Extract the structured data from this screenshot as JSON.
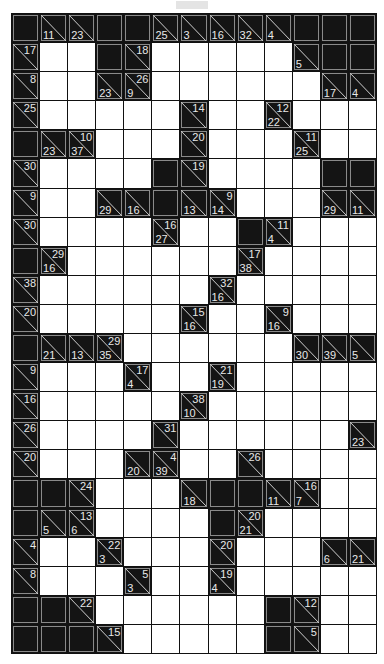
{
  "puzzle": {
    "type": "kakuro",
    "cols": 13,
    "rows": 22,
    "grid": [
      [
        "B",
        {
          "d": 11
        },
        {
          "d": 23
        },
        "B",
        "B",
        {
          "d": 25
        },
        {
          "d": 3
        },
        {
          "d": 16
        },
        {
          "d": 32
        },
        {
          "d": 4
        },
        "B",
        "B",
        "B"
      ],
      [
        {
          "r": 17
        },
        "W",
        "W",
        "B",
        {
          "r": 18
        },
        "W",
        "W",
        "W",
        "W",
        "W",
        {
          "d": 5
        },
        "B",
        "B"
      ],
      [
        {
          "r": 8
        },
        "W",
        "W",
        {
          "d": 23
        },
        {
          "r": 26,
          "d": 9
        },
        "W",
        "W",
        "W",
        "W",
        "W",
        "W",
        {
          "d": 17
        },
        {
          "d": 4
        }
      ],
      [
        {
          "r": 25
        },
        "W",
        "W",
        "W",
        "W",
        "W",
        {
          "r": 14
        },
        "W",
        "W",
        {
          "r": 12,
          "d": 22
        },
        "W",
        "W",
        "W"
      ],
      [
        "B",
        {
          "d": 23
        },
        {
          "r": 10,
          "d": 37
        },
        "W",
        "W",
        "W",
        {
          "r": 20
        },
        "W",
        "W",
        "W",
        {
          "r": 11,
          "d": 25
        },
        "W",
        "W"
      ],
      [
        {
          "r": 30
        },
        "W",
        "W",
        "W",
        "W",
        "B",
        {
          "r": 19
        },
        "W",
        "W",
        "W",
        "W",
        "B",
        "B"
      ],
      [
        {
          "r": 9
        },
        "W",
        "W",
        {
          "d": 29
        },
        {
          "d": 16
        },
        "B",
        {
          "d": 13
        },
        {
          "r": 9,
          "d": 14
        },
        "W",
        "W",
        "W",
        {
          "d": 29
        },
        {
          "d": 11
        }
      ],
      [
        {
          "r": 30
        },
        "W",
        "W",
        "W",
        "W",
        {
          "r": 16,
          "d": 27
        },
        "W",
        "W",
        "B",
        {
          "r": 11,
          "d": 4
        },
        "W",
        "W",
        "W"
      ],
      [
        "B",
        {
          "r": 29,
          "d": 16
        },
        "W",
        "W",
        "W",
        "W",
        "W",
        "W",
        {
          "r": 17,
          "d": 38
        },
        "W",
        "W",
        "W",
        "W"
      ],
      [
        {
          "r": 38
        },
        "W",
        "W",
        "W",
        "W",
        "W",
        "W",
        {
          "r": 32,
          "d": 16
        },
        "W",
        "W",
        "W",
        "W",
        "W"
      ],
      [
        {
          "r": 20
        },
        "W",
        "W",
        "W",
        "W",
        "W",
        {
          "r": 15,
          "d": 16
        },
        "W",
        "W",
        {
          "r": 9,
          "d": 16
        },
        "W",
        "W",
        "W"
      ],
      [
        "B",
        {
          "d": 21
        },
        {
          "d": 13
        },
        {
          "r": 29,
          "d": 35
        },
        "W",
        "W",
        "W",
        "W",
        "W",
        "W",
        {
          "d": 30
        },
        {
          "d": 39
        },
        {
          "d": 5
        }
      ],
      [
        {
          "r": 9
        },
        "W",
        "W",
        "W",
        {
          "r": 17,
          "d": 4
        },
        "W",
        "W",
        {
          "r": 21,
          "d": 19
        },
        "W",
        "W",
        "W",
        "W",
        "W"
      ],
      [
        {
          "r": 16
        },
        "W",
        "W",
        "W",
        "W",
        "W",
        {
          "r": 38,
          "d": 10
        },
        "W",
        "W",
        "W",
        "W",
        "W",
        "W"
      ],
      [
        {
          "r": 26
        },
        "W",
        "W",
        "W",
        "W",
        {
          "r": 31
        },
        "W",
        "W",
        "W",
        "W",
        "W",
        "W",
        {
          "d": 23
        }
      ],
      [
        {
          "r": 20
        },
        "W",
        "W",
        "W",
        {
          "d": 20
        },
        {
          "r": 4,
          "d": 39
        },
        "W",
        "W",
        {
          "r": 26
        },
        "W",
        "W",
        "W",
        "W"
      ],
      [
        "B",
        "B",
        {
          "r": 24
        },
        "W",
        "W",
        "W",
        {
          "d": 18
        },
        "B",
        "B",
        {
          "d": 11
        },
        {
          "r": 16,
          "d": 7
        },
        "W",
        "W"
      ],
      [
        "B",
        {
          "d": 5
        },
        {
          "r": 13,
          "d": 6
        },
        "W",
        "W",
        "W",
        "W",
        "B",
        {
          "r": 20,
          "d": 21
        },
        "W",
        "W",
        "W",
        "W"
      ],
      [
        {
          "r": 4
        },
        "W",
        "W",
        {
          "r": 22,
          "d": 3
        },
        "W",
        "W",
        "W",
        {
          "r": 20
        },
        "W",
        "W",
        "W",
        {
          "d": 6
        },
        {
          "d": 21
        }
      ],
      [
        {
          "r": 8
        },
        "W",
        "W",
        "W",
        {
          "r": 5,
          "d": 3
        },
        "W",
        "W",
        {
          "r": 19,
          "d": 4
        },
        "W",
        "W",
        "W",
        "W",
        "W"
      ],
      [
        "B",
        "B",
        {
          "r": 22
        },
        "W",
        "W",
        "W",
        "W",
        "W",
        "W",
        "B",
        {
          "r": 12
        },
        "W",
        "W"
      ],
      [
        "B",
        "B",
        "B",
        {
          "r": 15
        },
        "W",
        "W",
        "W",
        "W",
        "W",
        "B",
        {
          "r": 5
        },
        "W",
        "W"
      ]
    ]
  }
}
